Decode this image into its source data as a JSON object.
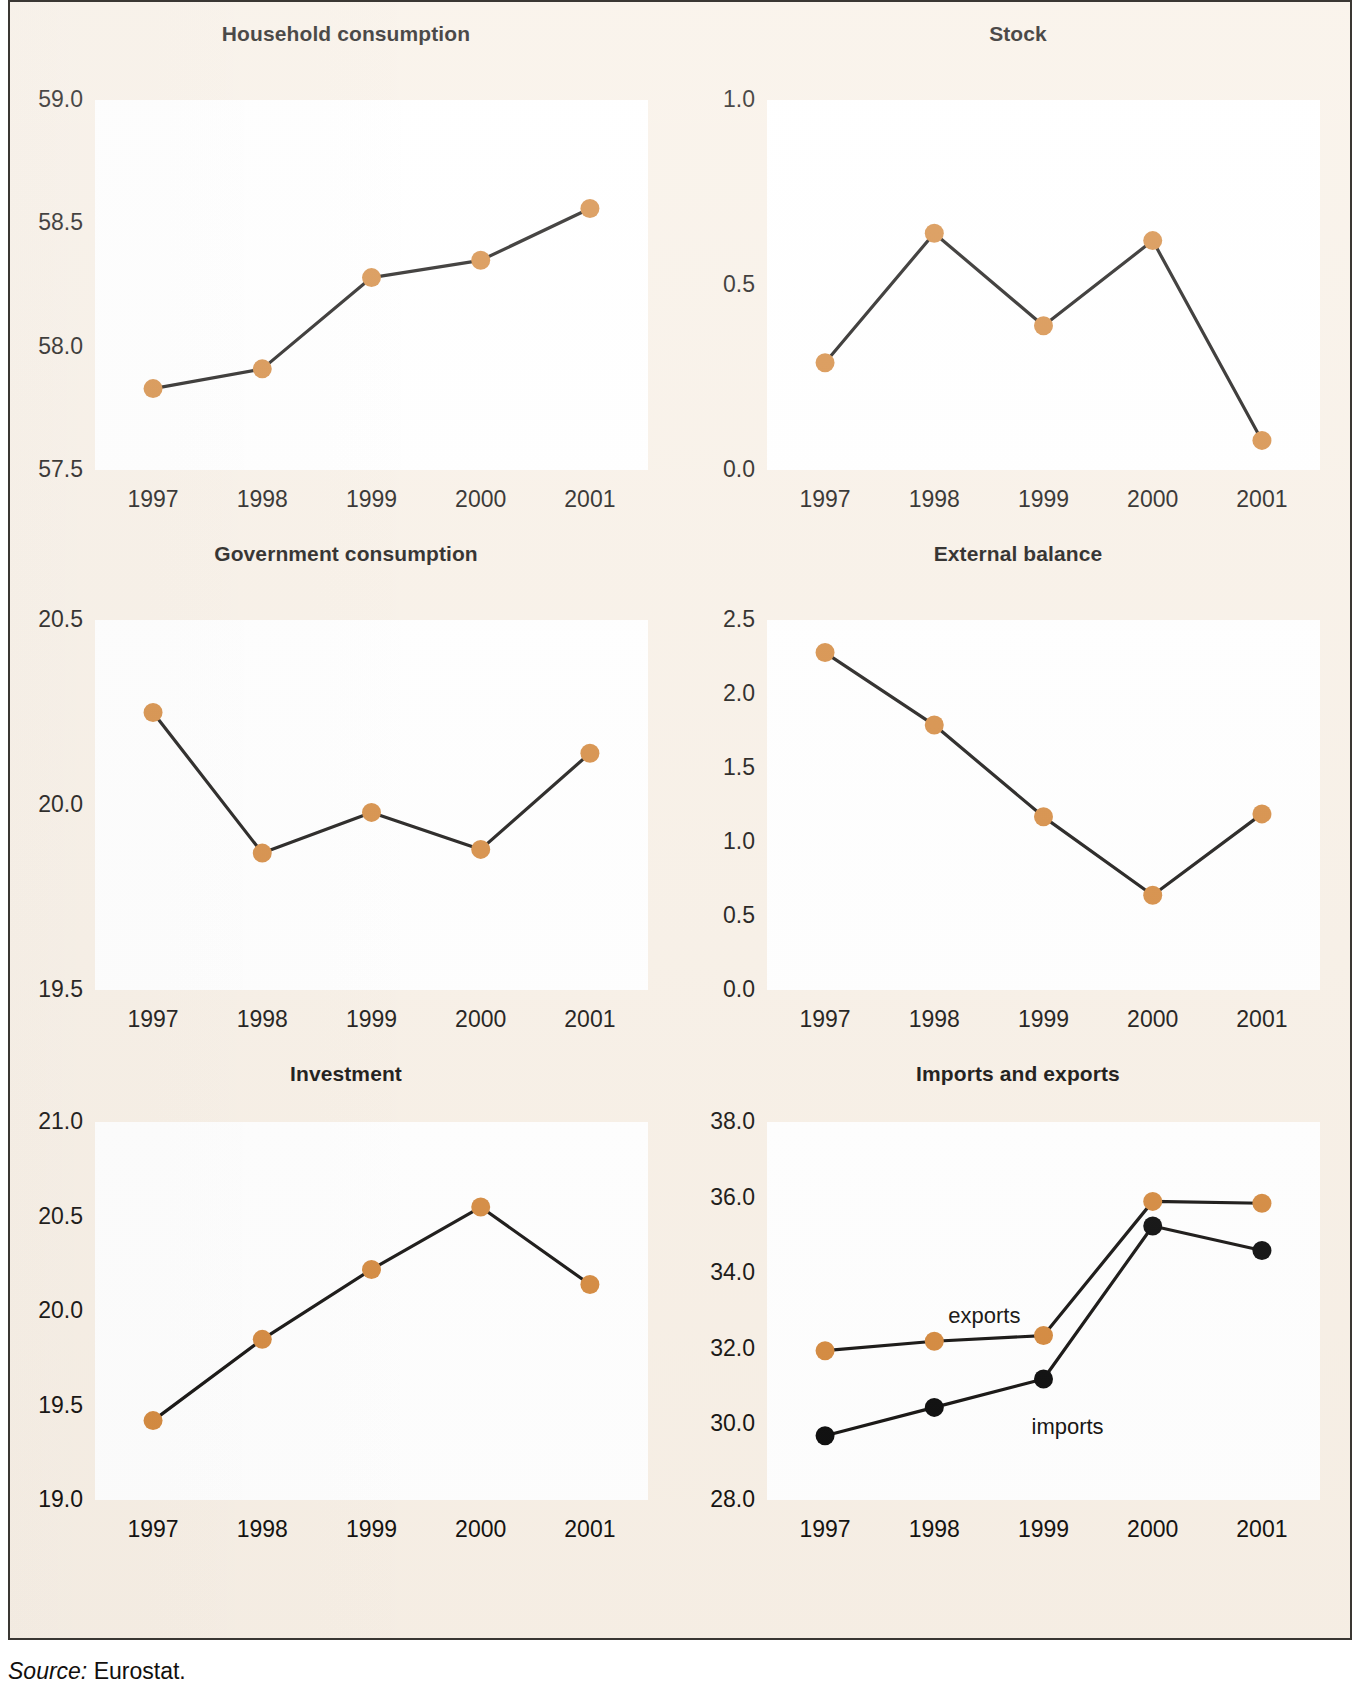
{
  "figure": {
    "background_color": "#f8f0e6",
    "plot_background_color": "#ffffff",
    "border_color": "#3a3733",
    "marker_orange": "#d4883c",
    "marker_black": "#0a0a0a",
    "line_color": "#141210"
  },
  "source": {
    "label": "Source:",
    "value": "Eurostat."
  },
  "chart_data": [
    {
      "type": "line",
      "title": "Household consumption",
      "xlabel": "",
      "ylabel": "",
      "categories": [
        "1997",
        "1998",
        "1999",
        "2000",
        "2001"
      ],
      "yticks": [
        "57.5",
        "58.0",
        "58.5",
        "59.0"
      ],
      "ylim": [
        57.5,
        59.0
      ],
      "grid": false,
      "legend": "none",
      "series": [
        {
          "name": "Household consumption",
          "color": "#d4883c",
          "values": [
            57.83,
            57.91,
            58.28,
            58.35,
            58.56
          ]
        }
      ]
    },
    {
      "type": "line",
      "title": "Stock",
      "xlabel": "",
      "ylabel": "",
      "categories": [
        "1997",
        "1998",
        "1999",
        "2000",
        "2001"
      ],
      "yticks": [
        "0.0",
        "0.5",
        "1.0"
      ],
      "ylim": [
        0.0,
        1.0
      ],
      "grid": false,
      "legend": "none",
      "series": [
        {
          "name": "Stock",
          "color": "#d4883c",
          "values": [
            0.29,
            0.64,
            0.39,
            0.62,
            0.08
          ]
        }
      ]
    },
    {
      "type": "line",
      "title": "Government consumption",
      "xlabel": "",
      "ylabel": "",
      "categories": [
        "1997",
        "1998",
        "1999",
        "2000",
        "2001"
      ],
      "yticks": [
        "19.5",
        "20.0",
        "20.5"
      ],
      "ylim": [
        19.5,
        20.5
      ],
      "grid": false,
      "legend": "none",
      "series": [
        {
          "name": "Government consumption",
          "color": "#d4883c",
          "values": [
            20.25,
            19.87,
            19.98,
            19.88,
            20.14
          ]
        }
      ]
    },
    {
      "type": "line",
      "title": "External balance",
      "xlabel": "",
      "ylabel": "",
      "categories": [
        "1997",
        "1998",
        "1999",
        "2000",
        "2001"
      ],
      "yticks": [
        "0.0",
        "0.5",
        "1.0",
        "1.5",
        "2.0",
        "2.5"
      ],
      "ylim": [
        0.0,
        2.5
      ],
      "grid": false,
      "legend": "none",
      "series": [
        {
          "name": "External balance",
          "color": "#d4883c",
          "values": [
            2.28,
            1.79,
            1.17,
            0.64,
            1.19
          ]
        }
      ]
    },
    {
      "type": "line",
      "title": "Investment",
      "xlabel": "",
      "ylabel": "",
      "categories": [
        "1997",
        "1998",
        "1999",
        "2000",
        "2001"
      ],
      "yticks": [
        "19.0",
        "19.5",
        "20.0",
        "20.5",
        "21.0"
      ],
      "ylim": [
        19.0,
        21.0
      ],
      "grid": false,
      "legend": "none",
      "series": [
        {
          "name": "Investment",
          "color": "#d4883c",
          "values": [
            19.42,
            19.85,
            20.22,
            20.55,
            20.14
          ]
        }
      ]
    },
    {
      "type": "line",
      "title": "Imports and exports",
      "xlabel": "",
      "ylabel": "",
      "categories": [
        "1997",
        "1998",
        "1999",
        "2000",
        "2001"
      ],
      "yticks": [
        "28.0",
        "30.0",
        "32.0",
        "34.0",
        "36.0",
        "38.0"
      ],
      "ylim": [
        28.0,
        38.0
      ],
      "grid": false,
      "legend": "inline-annotations",
      "annotations": [
        {
          "text": "exports",
          "near": "exports-series"
        },
        {
          "text": "imports",
          "near": "imports-series"
        }
      ],
      "series": [
        {
          "name": "exports",
          "color": "#d4883c",
          "values": [
            31.95,
            32.2,
            32.35,
            35.9,
            35.85
          ]
        },
        {
          "name": "imports",
          "color": "#0a0a0a",
          "values": [
            29.7,
            30.45,
            31.2,
            35.25,
            34.6
          ]
        }
      ]
    }
  ]
}
